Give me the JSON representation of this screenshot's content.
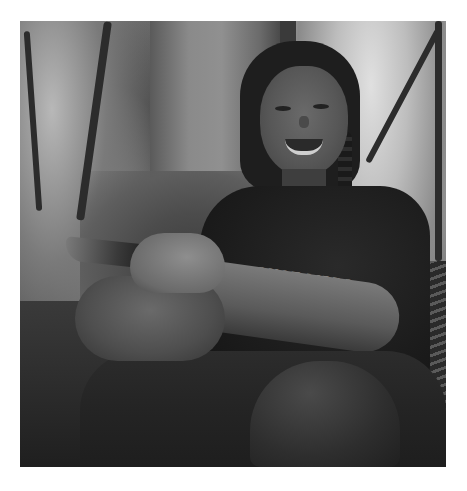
{
  "image": {
    "type": "photograph",
    "color_mode": "grayscale",
    "description": "Smiling woman with dark braided hair seated in a forest in front of a tree trunk, holding a small dark bird in her hands",
    "frame": {
      "left": 20,
      "top": 21,
      "width": 426,
      "height": 446,
      "border_color": "#ffffff"
    }
  },
  "shirt_text": "QUOT LIBRO",
  "tones": {
    "background_light": "#cfcfcf",
    "trunk": "#8a8a8a",
    "shirt": "#1c1c1c",
    "skin": "#6a6a6a",
    "shadow": "#1f1f1f"
  }
}
